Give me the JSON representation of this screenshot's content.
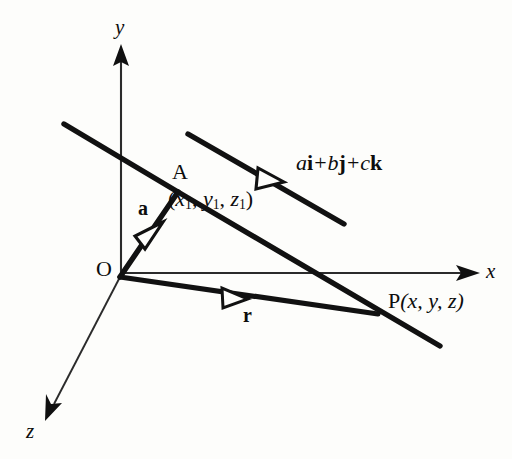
{
  "figure": {
    "background_color": "#fdfdfb",
    "ink_color": "#0d0d0d"
  },
  "axes": {
    "x": {
      "label": "x",
      "arrow_tip": [
        478,
        273
      ],
      "origin": [
        120,
        273
      ]
    },
    "y": {
      "label": "y",
      "arrow_tip": [
        121,
        48
      ],
      "origin": [
        121,
        277
      ]
    },
    "z": {
      "label": "z",
      "arrow_tip": [
        45,
        414
      ],
      "origin": [
        120,
        277
      ]
    }
  },
  "points": {
    "origin": {
      "label": "O",
      "at": [
        120,
        277
      ]
    },
    "A": {
      "label": "A",
      "at": [
        178,
        192
      ]
    },
    "A_coords": {
      "label": "(x1, y1, z1)",
      "x_sub": "x",
      "y_sub": "y",
      "z_sub": "z",
      "sub_index": "1"
    },
    "P": {
      "label": "P(x, y, z)",
      "letter": "P",
      "coords": "(x, y, z)",
      "at": [
        375,
        313
      ]
    }
  },
  "vectors": {
    "a": {
      "label": "a",
      "from": "O",
      "to": "A",
      "description": "position vector of point A"
    },
    "r": {
      "label": "r",
      "from": "O",
      "to": "P",
      "description": "position vector of point P"
    },
    "direction": {
      "label_parts": [
        {
          "text": "a",
          "style": "italic"
        },
        {
          "text": "i",
          "style": "bold"
        },
        {
          "text": "+",
          "style": "op"
        },
        {
          "text": "b",
          "style": "italic"
        },
        {
          "text": "j",
          "style": "bold"
        },
        {
          "text": "+",
          "style": "op"
        },
        {
          "text": "c",
          "style": "italic"
        },
        {
          "text": "k",
          "style": "bold"
        }
      ],
      "label_plain": "ai + bj + ck",
      "description": "direction vector of the line"
    }
  },
  "lines": {
    "through_A": {
      "from": [
        64,
        124
      ],
      "to": [
        238,
        224
      ],
      "description": "straight line passing through A"
    },
    "through_P": {
      "from": [
        178,
        192
      ],
      "to": [
        440,
        346
      ],
      "description": "straight line passing through P"
    },
    "direction_segment": {
      "from": [
        188,
        134
      ],
      "to": [
        344,
        224
      ],
      "description": "parallel direction vector segment"
    }
  },
  "chart_data": {
    "type": "diagram",
    "elements": [
      {
        "name": "y-axis",
        "kind": "axis",
        "label": "y"
      },
      {
        "name": "x-axis",
        "kind": "axis",
        "label": "x"
      },
      {
        "name": "z-axis",
        "kind": "axis",
        "label": "z"
      },
      {
        "name": "origin",
        "kind": "point",
        "label": "O"
      },
      {
        "name": "point-A",
        "kind": "point",
        "label": "A",
        "coords": "(x1, y1, z1)"
      },
      {
        "name": "point-P",
        "kind": "point",
        "label": "P(x, y, z)"
      },
      {
        "name": "vector-a",
        "kind": "vector",
        "label": "a"
      },
      {
        "name": "vector-r",
        "kind": "vector",
        "label": "r"
      },
      {
        "name": "direction-vector",
        "kind": "vector",
        "label": "ai + bj + ck"
      }
    ]
  }
}
